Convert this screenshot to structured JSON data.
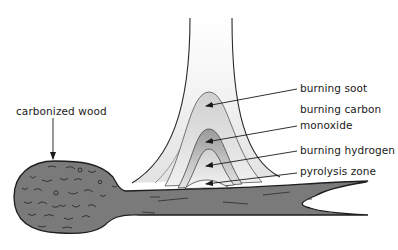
{
  "diagram": {
    "labels": {
      "carbonized_wood": "carbonized wood",
      "burning_soot": "burning soot",
      "burning_carbon": "burning carbon",
      "monoxide": "monoxide",
      "burning_hydrogen": "burning hydrogen",
      "pyrolysis_zone": "pyrolysis zone"
    },
    "colors": {
      "line": "#2a2a2a",
      "wood_fill": "#7a7a7a",
      "flame_light": "#ececec",
      "soot_zone": "#d8d8d8",
      "co_zone": "#a8a8a8",
      "background": "#ffffff"
    }
  }
}
